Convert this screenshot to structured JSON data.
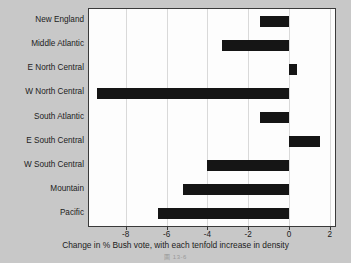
{
  "chart_data": {
    "type": "bar",
    "orientation": "horizontal",
    "title": "",
    "xlabel": "Change in % Bush vote, with each tenfold increase in density",
    "ylabel": "",
    "xlim": [
      -9.8,
      2.25
    ],
    "xticks": [
      -8,
      -6,
      -4,
      -2,
      0,
      2
    ],
    "xtick_labels": [
      "-8",
      "-6",
      "-4",
      "-2",
      "0",
      "2"
    ],
    "grid": true,
    "legend": null,
    "zero_line": 0,
    "categories": [
      "New England",
      "Middle Atlantic",
      "E North Central",
      "W North Central",
      "South Atlantic",
      "E South Central",
      "W South Central",
      "Mountain",
      "Pacific"
    ],
    "values": [
      -1.4,
      -3.3,
      0.4,
      -9.4,
      -1.4,
      1.5,
      -4.0,
      -5.2,
      -6.4
    ],
    "bar_color": "#151515"
  },
  "caption": "圖 13-6",
  "colors": {
    "background": "#c8c8c8",
    "plot_background": "#fdfdfd",
    "axis": "#3a3a3a",
    "gridline": "#d9d9d9",
    "text": "#1c1c1c",
    "bar": "#151515"
  }
}
